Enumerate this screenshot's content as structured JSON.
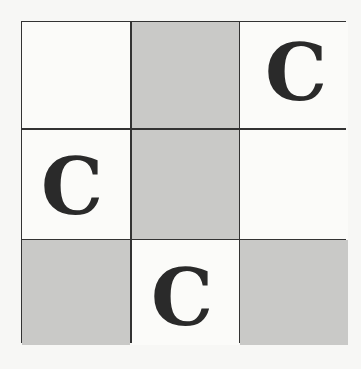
{
  "puzzle": {
    "rows": 3,
    "cols": 3,
    "cells": [
      [
        {
          "shaded": false,
          "letter": ""
        },
        {
          "shaded": true,
          "letter": ""
        },
        {
          "shaded": false,
          "letter": "C"
        }
      ],
      [
        {
          "shaded": false,
          "letter": "C"
        },
        {
          "shaded": true,
          "letter": ""
        },
        {
          "shaded": false,
          "letter": ""
        }
      ],
      [
        {
          "shaded": true,
          "letter": ""
        },
        {
          "shaded": false,
          "letter": "C"
        },
        {
          "shaded": true,
          "letter": ""
        }
      ]
    ]
  },
  "colors": {
    "shaded": "#c9c9c7",
    "unshaded": "#fbfbf9",
    "grid_line": "#333333",
    "letter": "#2a2a2a"
  }
}
